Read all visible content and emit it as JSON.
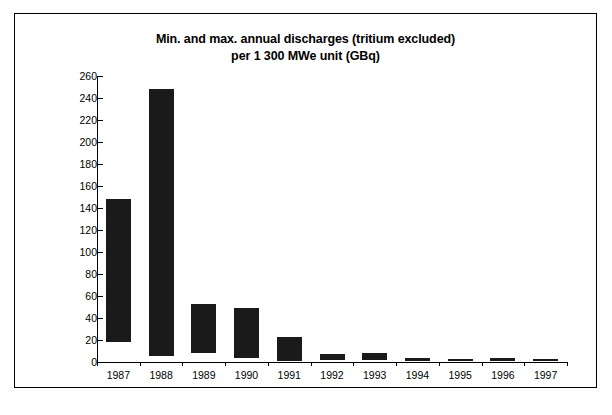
{
  "chart_data": {
    "type": "bar",
    "bar_style": "floating-range",
    "title": "Min. and max. annual discharges (tritium excluded)",
    "subtitle": "per 1 300 MWe unit (GBq)",
    "title_line1": "Min. and max. annual discharges (tritium excluded)",
    "title_line2": "per 1 300 MWe unit (GBq)",
    "xlabel": "",
    "ylabel": "",
    "unit": "GBq",
    "categories": [
      "1987",
      "1988",
      "1989",
      "1990",
      "1991",
      "1992",
      "1993",
      "1994",
      "1995",
      "1996",
      "1997"
    ],
    "series": [
      {
        "name": "Minimum",
        "values": [
          18,
          5,
          8,
          4,
          1,
          1.5,
          1.5,
          1,
          1,
          1,
          1
        ]
      },
      {
        "name": "Maximum",
        "values": [
          148,
          248,
          53,
          49,
          23,
          7,
          8,
          4,
          3,
          3.5,
          3
        ]
      }
    ],
    "values": [
      148,
      248,
      53,
      49,
      23,
      7,
      8,
      4,
      3,
      3.5,
      3
    ],
    "ylim": [
      0,
      260
    ],
    "ytick_step": 20,
    "yticks": [
      0,
      20,
      40,
      60,
      80,
      100,
      120,
      140,
      160,
      180,
      200,
      220,
      240,
      260
    ],
    "grid": false,
    "legend": null,
    "legend_position": "none",
    "bar_color": "#1a1a1a",
    "axis_color": "#000000",
    "background_color": "#ffffff",
    "frame_color": "#000000"
  }
}
